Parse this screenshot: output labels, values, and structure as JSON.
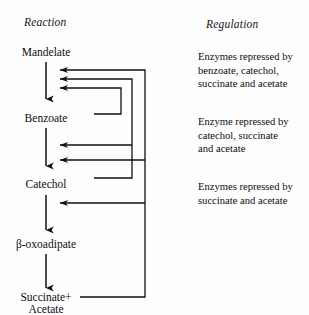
{
  "figure": {
    "headers": {
      "reaction": "Reaction",
      "regulation": "Regulation"
    },
    "pathway": {
      "steps": [
        {
          "id": "mandelate",
          "label": "Mandelate"
        },
        {
          "id": "benzoate",
          "label": "Benzoate"
        },
        {
          "id": "catechol",
          "label": "Catechol"
        },
        {
          "id": "oxoadipate",
          "label": "β-oxoadipate"
        },
        {
          "id": "succinate-acetate",
          "label": "Succinate+",
          "label2": "Acetate"
        }
      ]
    },
    "regulation_blocks": [
      {
        "id": "block-mandelate",
        "lines": [
          "Enzymes repressed by",
          "benzoate, catechol,",
          "succinate and acetate"
        ]
      },
      {
        "id": "block-benzoate",
        "lines": [
          "Enzyme repressed by",
          "catechol, succinate",
          "and acetate"
        ]
      },
      {
        "id": "block-catechol",
        "lines": [
          "Enzymes repressed by",
          "succinate and acetate"
        ]
      }
    ],
    "feedback_loops": [
      {
        "id": "benzoate-to-mandelate",
        "source": "benzoate",
        "target": "mandelate-step",
        "description": "benzoate represses mandelate enzymes"
      },
      {
        "id": "catechol-to-mandelate",
        "source": "catechol",
        "target": "mandelate-step",
        "description": "catechol represses mandelate enzymes"
      },
      {
        "id": "catechol-to-benzoate",
        "source": "catechol",
        "target": "benzoate-step",
        "description": "catechol represses benzoate enzyme"
      },
      {
        "id": "products-to-mandelate",
        "source": "succinate-acetate",
        "target": "mandelate-step",
        "description": "succinate and acetate repress mandelate enzymes"
      },
      {
        "id": "products-to-benzoate",
        "source": "succinate-acetate",
        "target": "benzoate-step",
        "description": "succinate and acetate repress benzoate enzyme"
      },
      {
        "id": "products-to-catechol",
        "source": "succinate-acetate",
        "target": "catechol-step",
        "description": "succinate and acetate repress catechol enzymes"
      }
    ],
    "colors": {
      "ink": "#111111",
      "background": "#fdfdfd"
    }
  }
}
